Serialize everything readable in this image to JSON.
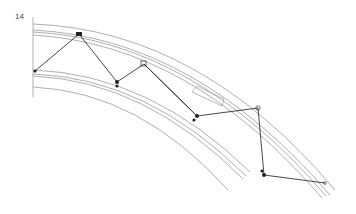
{
  "figure": {
    "number": "14"
  },
  "colors": {
    "chord_line": "#9a9a9a",
    "brace_line": "#333333",
    "node": "#222222"
  }
}
